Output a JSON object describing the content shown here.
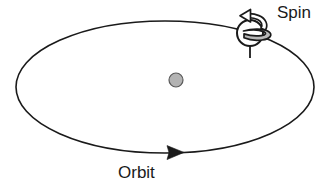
{
  "diagram": {
    "type": "astronomy-schematic",
    "background_color": "#ffffff",
    "stroke_color": "#1a1a1a",
    "labels": {
      "spin": "Spin",
      "orbit": "Orbit"
    },
    "elements": {
      "orbit_ellipse": {
        "name": "orbit-path",
        "center_x": 165,
        "center_y": 87,
        "radius_x": 149,
        "radius_y": 66,
        "stroke": "#1a1a1a",
        "stroke_width": 1.6,
        "fill": "none"
      },
      "central_body": {
        "name": "central-body",
        "center_x": 176,
        "center_y": 80,
        "radius": 7,
        "fill": "#b3b3b3",
        "stroke": "#4d4d4d",
        "stroke_width": 1.2
      },
      "orbiting_body": {
        "name": "orbiting-body",
        "center_x": 250,
        "center_y": 33,
        "radius": 13,
        "fill": "#ffffff",
        "stroke": "#1a1a1a",
        "stroke_width": 2
      },
      "spin_axis": {
        "name": "spin-axis",
        "x": 250,
        "y_top": 12,
        "y_bottom": 58,
        "stroke": "#1a1a1a",
        "stroke_width": 1.8
      },
      "spin_arrow": {
        "name": "spin-arrow",
        "direction": "counter-clockwise-from-above",
        "fill": "#b8b8b8",
        "stroke": "#1a1a1a",
        "stroke_width": 1.8
      },
      "orbit_arrow": {
        "name": "orbit-direction-arrow",
        "direction": "right",
        "tip_x": 184,
        "tip_y": 152,
        "fill": "#1a1a1a"
      }
    },
    "label_positions": {
      "spin": {
        "x": 277,
        "y": 18
      },
      "orbit": {
        "x": 118,
        "y": 178
      }
    }
  }
}
